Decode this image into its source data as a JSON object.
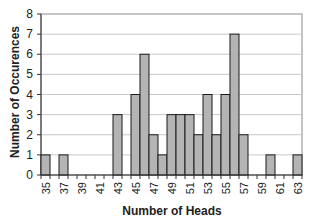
{
  "chart_data": {
    "type": "bar",
    "title": "",
    "xlabel": "Number of Heads",
    "ylabel": "Number of Occurences",
    "ylim": [
      0,
      8
    ],
    "yticks": [
      0,
      1,
      2,
      3,
      4,
      5,
      6,
      7,
      8
    ],
    "grid": true,
    "legend": null,
    "categories": [
      35,
      36,
      37,
      38,
      39,
      40,
      41,
      42,
      43,
      44,
      45,
      46,
      47,
      48,
      49,
      50,
      51,
      52,
      53,
      54,
      55,
      56,
      57,
      58,
      59,
      60,
      61,
      62,
      63
    ],
    "x_tick_labels": [
      "35",
      "37",
      "39",
      "41",
      "43",
      "45",
      "47",
      "49",
      "51",
      "53",
      "55",
      "57",
      "59",
      "61",
      "63"
    ],
    "values": [
      1,
      0,
      1,
      0,
      0,
      0,
      0,
      0,
      3,
      0,
      4,
      6,
      2,
      1,
      3,
      3,
      3,
      2,
      4,
      2,
      4,
      7,
      2,
      0,
      0,
      1,
      0,
      0,
      1
    ],
    "colors": {
      "bar_fill": "#b4b4b4",
      "bar_stroke": "#1a1a1a",
      "grid": "#c8c8c8",
      "frame": "#888888"
    }
  }
}
